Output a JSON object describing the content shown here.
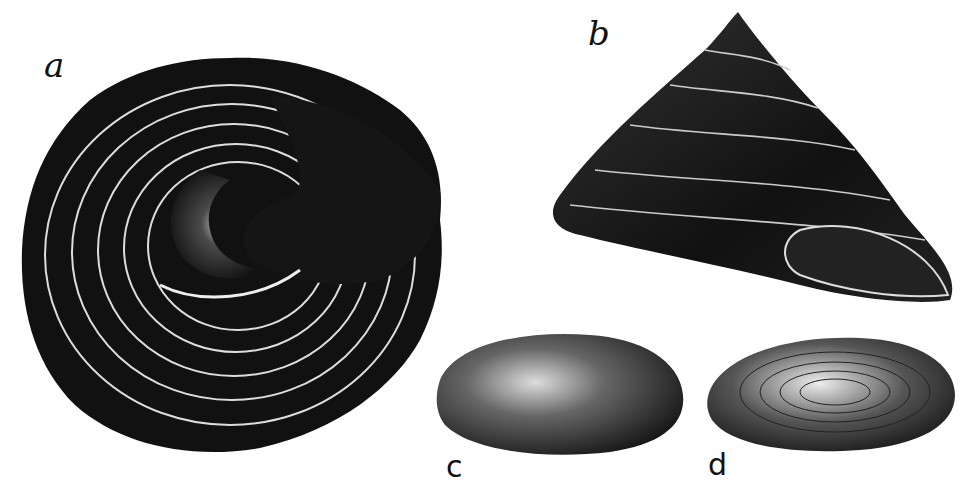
{
  "figure": {
    "background": "#ffffff",
    "ink": "#111111",
    "specimens": [
      {
        "id": "a",
        "label": "a",
        "description": "shell viewed from below showing spiral whorls and aperture"
      },
      {
        "id": "b",
        "label": "b",
        "description": "conical shell with beaded spiral ribs, side view"
      },
      {
        "id": "c",
        "label": "c",
        "description": "smooth oval operculum, outer face"
      },
      {
        "id": "d",
        "label": "d",
        "description": "oval operculum, inner face with fine concentric lines"
      }
    ]
  }
}
